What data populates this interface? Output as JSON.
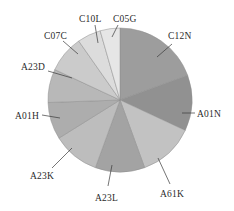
{
  "chart_data": {
    "type": "pie",
    "title": "",
    "subtitle": "",
    "xlabel": "",
    "ylabel": "",
    "legend_position": "none",
    "grid": false,
    "labels_outside": true,
    "start_angle_deg": 0,
    "direction": "clockwise",
    "categories": [
      "C12N",
      "A01N",
      "A61K",
      "A23L",
      "A23K",
      "A01H",
      "A23D",
      "C07C",
      "C10L",
      "C05G"
    ],
    "values": [
      19.4,
      12.5,
      12.5,
      11.1,
      10.6,
      8.3,
      7.5,
      8.3,
      5.3,
      4.5
    ],
    "slices": [
      {
        "label": "C12N",
        "value": 19.4,
        "start_deg": 0,
        "end_deg": 70,
        "color": "#9d9d9d"
      },
      {
        "label": "A01N",
        "value": 12.5,
        "start_deg": 70,
        "end_deg": 115,
        "color": "#919191"
      },
      {
        "label": "A61K",
        "value": 12.5,
        "start_deg": 115,
        "end_deg": 160,
        "color": "#c2c2c2"
      },
      {
        "label": "A23L",
        "value": 11.1,
        "start_deg": 160,
        "end_deg": 200,
        "color": "#a3a3a3"
      },
      {
        "label": "A23K",
        "value": 10.6,
        "start_deg": 200,
        "end_deg": 238,
        "color": "#bdbdbd"
      },
      {
        "label": "A01H",
        "value": 8.3,
        "start_deg": 238,
        "end_deg": 268,
        "color": "#adadad"
      },
      {
        "label": "A23D",
        "value": 7.5,
        "start_deg": 268,
        "end_deg": 295,
        "color": "#b8b8b8"
      },
      {
        "label": "C07C",
        "value": 8.3,
        "start_deg": 295,
        "end_deg": 325,
        "color": "#cbcbcb"
      },
      {
        "label": "C10L",
        "value": 5.3,
        "start_deg": 325,
        "end_deg": 344,
        "color": "#dcdcdc"
      },
      {
        "label": "C05G",
        "value": 4.5,
        "start_deg": 344,
        "end_deg": 360,
        "color": "#e6e6e6"
      }
    ],
    "geometry": {
      "cx": 120,
      "cy": 100,
      "r": 72
    },
    "annotations": [
      {
        "label": "C12N",
        "text_x": 168,
        "text_y": 32,
        "line_x1": 172,
        "line_y1": 44,
        "line_x2": 157,
        "line_y2": 57
      },
      {
        "label": "A01N",
        "text_x": 197,
        "text_y": 110,
        "line_x1": 195,
        "line_y1": 113,
        "line_x2": 182,
        "line_y2": 113
      },
      {
        "label": "A61K",
        "text_x": 160,
        "text_y": 190,
        "line_x1": 170,
        "line_y1": 184,
        "line_x2": 158,
        "line_y2": 158
      },
      {
        "label": "A23L",
        "text_x": 95,
        "text_y": 194,
        "line_x1": 108,
        "line_y1": 186,
        "line_x2": 112,
        "line_y2": 165
      },
      {
        "label": "A23K",
        "text_x": 30,
        "text_y": 172,
        "line_x1": 52,
        "line_y1": 168,
        "line_x2": 72,
        "line_y2": 148
      },
      {
        "label": "A01H",
        "text_x": 15,
        "text_y": 112,
        "line_x1": 42,
        "line_y1": 115,
        "line_x2": 60,
        "line_y2": 118
      },
      {
        "label": "A23D",
        "text_x": 21,
        "text_y": 63,
        "line_x1": 48,
        "line_y1": 71,
        "line_x2": 72,
        "line_y2": 78
      },
      {
        "label": "C07C",
        "text_x": 44,
        "text_y": 32,
        "line_x1": 63,
        "line_y1": 41,
        "line_x2": 78,
        "line_y2": 54
      },
      {
        "label": "C10L",
        "text_x": 79,
        "text_y": 15,
        "line_x1": 95,
        "line_y1": 25,
        "line_x2": 98,
        "line_y2": 43
      },
      {
        "label": "C05G",
        "text_x": 113,
        "text_y": 15,
        "line_x1": 118,
        "line_y1": 25,
        "line_x2": 112,
        "line_y2": 37
      }
    ]
  },
  "colors": {
    "background": "#ffffff",
    "text": "#2b2b2b",
    "leader_line": "#3a3a3a",
    "slice_stroke": "#8f8f8f"
  }
}
